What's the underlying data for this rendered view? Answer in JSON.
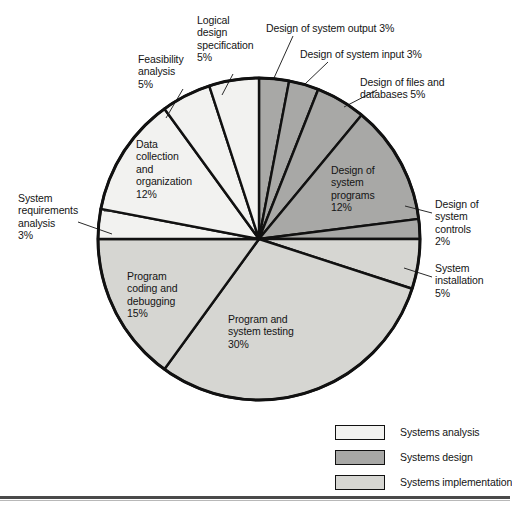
{
  "chart_data": {
    "type": "pie",
    "title": "",
    "total": 100,
    "unit": "%",
    "start_angle_deg": 0,
    "direction": "clockwise",
    "center": {
      "x": 259,
      "y": 239
    },
    "radius": 161,
    "groups": [
      {
        "name": "Systems analysis",
        "color": "#f2f2f0",
        "total": 25
      },
      {
        "name": "Systems design",
        "color": "#a8a8a6",
        "total": 25
      },
      {
        "name": "Systems implementation",
        "color": "#d6d6d2",
        "total": 50
      }
    ],
    "categories": [
      "Design of system output",
      "Design of system input",
      "Design of files and databases",
      "Design of system programs",
      "Design of system controls",
      "System installation",
      "Program and system testing",
      "Program coding and debugging",
      "System requirements analysis",
      "Data collection and organization",
      "Feasibility analysis",
      "Logical design specification"
    ],
    "values": [
      3,
      3,
      5,
      12,
      2,
      5,
      30,
      15,
      3,
      12,
      5,
      5
    ],
    "slices": [
      {
        "label": "Design of system output",
        "value": 3,
        "group": "Systems design",
        "color": "#a8a8a6"
      },
      {
        "label": "Design of system input",
        "value": 3,
        "group": "Systems design",
        "color": "#a8a8a6"
      },
      {
        "label": "Design of files and databases",
        "value": 5,
        "group": "Systems design",
        "color": "#a8a8a6"
      },
      {
        "label": "Design of system programs",
        "value": 12,
        "group": "Systems design",
        "color": "#a8a8a6"
      },
      {
        "label": "Design of system controls",
        "value": 2,
        "group": "Systems design",
        "color": "#a8a8a6"
      },
      {
        "label": "System installation",
        "value": 5,
        "group": "Systems implementation",
        "color": "#d6d6d2"
      },
      {
        "label": "Program and system testing",
        "value": 30,
        "group": "Systems implementation",
        "color": "#d6d6d2"
      },
      {
        "label": "Program coding and debugging",
        "value": 15,
        "group": "Systems implementation",
        "color": "#d6d6d2"
      },
      {
        "label": "System requirements analysis",
        "value": 3,
        "group": "Systems analysis",
        "color": "#f2f2f0"
      },
      {
        "label": "Data collection and organization",
        "value": 12,
        "group": "Systems analysis",
        "color": "#f2f2f0"
      },
      {
        "label": "Feasibility analysis",
        "value": 5,
        "group": "Systems analysis",
        "color": "#f2f2f0"
      },
      {
        "label": "Logical design specification",
        "value": 5,
        "group": "Systems analysis",
        "color": "#f2f2f0"
      }
    ],
    "legend_position": "bottom-right",
    "grid": false
  },
  "callouts": {
    "design_of_system_output": "Design of system output 3%",
    "design_of_system_input": "Design of system input 3%",
    "design_of_files_and_databases": "Design of files and\ndatabases 5%",
    "design_of_system_controls": "Design of\nsystem\ncontrols\n2%",
    "system_installation": "System\ninstallation\n5%",
    "system_requirements_analysis": "System\nrequirements\nanalysis\n3%",
    "feasibility_analysis": "Feasibility\nanalysis\n5%",
    "logical_design_specification": "Logical\ndesign\nspecification\n5%"
  },
  "inner_labels": {
    "data_collection_and_organization": "Data\ncollection\nand\norganization\n12%",
    "program_coding_and_debugging": "Program\ncoding and\ndebugging\n15%",
    "program_and_system_testing": "Program and\nsystem testing\n30%",
    "design_of_system_programs": "Design of\nsystem\nprograms\n12%"
  },
  "legend": {
    "items": [
      {
        "label": "Systems analysis",
        "color": "#f2f2f0"
      },
      {
        "label": "Systems design",
        "color": "#a8a8a6"
      },
      {
        "label": "Systems implementation",
        "color": "#d6d6d2"
      }
    ]
  },
  "footer": {
    "ghost_text": ""
  }
}
